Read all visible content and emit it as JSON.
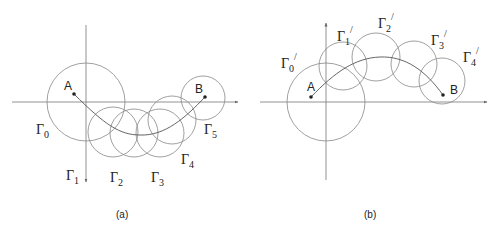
{
  "panels": [
    {
      "id": "a",
      "caption": "(a)",
      "points": {
        "A": "A",
        "B": "B"
      },
      "circles": [
        {
          "name": "Γ",
          "sub": "0",
          "prime": ""
        },
        {
          "name": "Γ",
          "sub": "1",
          "prime": ""
        },
        {
          "name": "Γ",
          "sub": "2",
          "prime": ""
        },
        {
          "name": "Γ",
          "sub": "3",
          "prime": ""
        },
        {
          "name": "Γ",
          "sub": "4",
          "prime": ""
        },
        {
          "name": "Γ",
          "sub": "5",
          "prime": ""
        }
      ]
    },
    {
      "id": "b",
      "caption": "(b)",
      "points": {
        "A": "A",
        "B": "B"
      },
      "circles": [
        {
          "name": "Γ",
          "sub": "0",
          "prime": "/"
        },
        {
          "name": "Γ",
          "sub": "1",
          "prime": "/"
        },
        {
          "name": "Γ",
          "sub": "2",
          "prime": "/"
        },
        {
          "name": "Γ",
          "sub": "3",
          "prime": "/"
        },
        {
          "name": "Γ",
          "sub": "4",
          "prime": "/"
        }
      ]
    }
  ],
  "colors": {
    "stroke": "#7a7a7a",
    "text": "#222222",
    "background": "#ffffff"
  }
}
